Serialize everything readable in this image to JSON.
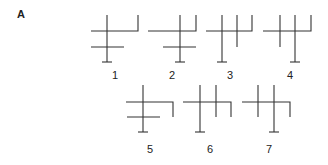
{
  "panel_label": "A",
  "stroke_color": "#333333",
  "figures": [
    {
      "label": "1",
      "id": "fig1"
    },
    {
      "label": "2",
      "id": "fig2"
    },
    {
      "label": "3",
      "id": "fig3"
    },
    {
      "label": "4",
      "id": "fig4"
    },
    {
      "label": "5",
      "id": "fig5"
    },
    {
      "label": "6",
      "id": "fig6"
    },
    {
      "label": "7",
      "id": "fig7"
    }
  ]
}
